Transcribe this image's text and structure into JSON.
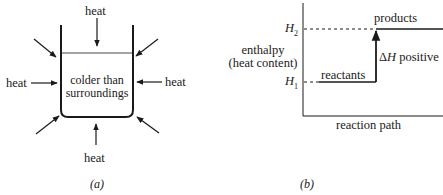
{
  "panel_a": {
    "caption": "(a)",
    "heat_label": "heat",
    "beaker_text_line1": "colder than",
    "beaker_text_line2": "surroundings",
    "arrows": [
      "top",
      "left",
      "right",
      "bottom",
      "upper-left",
      "upper-right",
      "lower-left",
      "lower-right"
    ]
  },
  "panel_b": {
    "caption": "(b)",
    "y_label_line1": "enthalpy",
    "y_label_line2": "(heat content)",
    "x_label": "reaction path",
    "h2_label": "H",
    "h2_sub": "2",
    "h1_label": "H",
    "h1_sub": "1",
    "products_label": "products",
    "reactants_label": "reactants",
    "delta_symbol": "Δ",
    "delta_var": "H",
    "delta_text": " positive"
  },
  "colors": {
    "ink": "#1a1a1a",
    "background": "#ffffff"
  }
}
